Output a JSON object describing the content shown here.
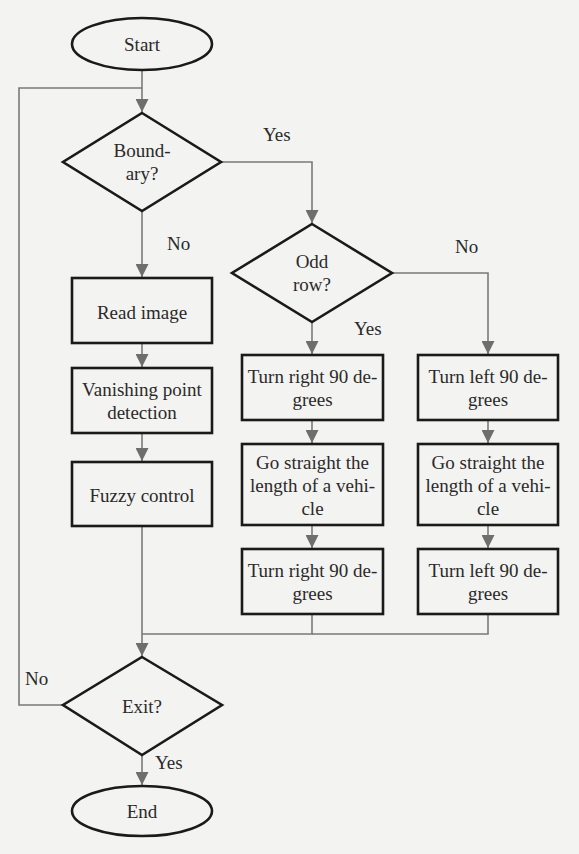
{
  "diagram": {
    "type": "flowchart",
    "colors": {
      "shape_stroke": "#1a1a1a",
      "connector": "#7a7a7a",
      "arrowhead": "#6e6e6e",
      "background": "#f3f3f1"
    },
    "nodes": {
      "start": {
        "shape": "terminator",
        "text": "Start"
      },
      "boundary": {
        "shape": "decision",
        "line1": "Bound-",
        "line2": "ary?"
      },
      "read_image": {
        "shape": "process",
        "text": "Read image"
      },
      "vanishing": {
        "shape": "process",
        "line1": "Vanishing point",
        "line2": "detection"
      },
      "fuzzy": {
        "shape": "process",
        "text": "Fuzzy control"
      },
      "odd_row": {
        "shape": "decision",
        "line1": "Odd",
        "line2": "row?"
      },
      "turn_right_1": {
        "shape": "process",
        "line1": "Turn right 90 de-",
        "line2": "grees"
      },
      "straight_right": {
        "shape": "process",
        "line1": "Go straight the",
        "line2": "length of a vehi-",
        "line3": "cle"
      },
      "turn_right_2": {
        "shape": "process",
        "line1": "Turn right 90 de-",
        "line2": "grees"
      },
      "turn_left_1": {
        "shape": "process",
        "line1": "Turn left 90 de-",
        "line2": "grees"
      },
      "straight_left": {
        "shape": "process",
        "line1": "Go straight the",
        "line2": "length of a vehi-",
        "line3": "cle"
      },
      "turn_left_2": {
        "shape": "process",
        "line1": "Turn left 90 de-",
        "line2": "grees"
      },
      "exit": {
        "shape": "decision",
        "text": "Exit?"
      },
      "end": {
        "shape": "terminator",
        "text": "End"
      }
    },
    "edge_labels": {
      "boundary_yes": "Yes",
      "boundary_no": "No",
      "odd_yes": "Yes",
      "odd_no": "No",
      "exit_no": "No",
      "exit_yes": "Yes"
    },
    "edges": [
      {
        "from": "start",
        "to": "boundary"
      },
      {
        "from": "boundary",
        "to": "odd_row",
        "label": "Yes"
      },
      {
        "from": "boundary",
        "to": "read_image",
        "label": "No"
      },
      {
        "from": "read_image",
        "to": "vanishing"
      },
      {
        "from": "vanishing",
        "to": "fuzzy"
      },
      {
        "from": "fuzzy",
        "to": "exit"
      },
      {
        "from": "odd_row",
        "to": "turn_right_1",
        "label": "Yes"
      },
      {
        "from": "odd_row",
        "to": "turn_left_1",
        "label": "No"
      },
      {
        "from": "turn_right_1",
        "to": "straight_right"
      },
      {
        "from": "straight_right",
        "to": "turn_right_2"
      },
      {
        "from": "turn_right_2",
        "to": "exit"
      },
      {
        "from": "turn_left_1",
        "to": "straight_left"
      },
      {
        "from": "straight_left",
        "to": "turn_left_2"
      },
      {
        "from": "turn_left_2",
        "to": "exit"
      },
      {
        "from": "exit",
        "to": "boundary",
        "label": "No"
      },
      {
        "from": "exit",
        "to": "end",
        "label": "Yes"
      }
    ]
  }
}
